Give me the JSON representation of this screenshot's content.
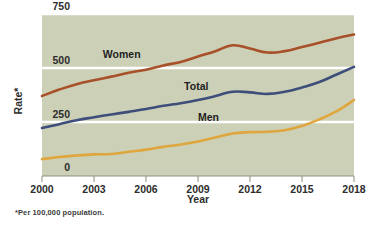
{
  "chart_data": {
    "type": "line",
    "title": "",
    "xlabel": "Year",
    "ylabel": "Rate*",
    "footnote": "*Per 100,000 population.",
    "x": [
      2000,
      2001,
      2002,
      2003,
      2004,
      2005,
      2006,
      2007,
      2008,
      2009,
      2010,
      2011,
      2012,
      2013,
      2014,
      2015,
      2016,
      2017,
      2018
    ],
    "xlim": [
      2000,
      2018
    ],
    "ylim": [
      0,
      750
    ],
    "yticks": [
      0,
      250,
      500,
      750
    ],
    "ytick_labels": [
      "0",
      "250",
      "500",
      "750"
    ],
    "xticks": [
      2000,
      2003,
      2006,
      2009,
      2012,
      2015,
      2018
    ],
    "xtick_labels": [
      "2000",
      "2003",
      "2006",
      "2009",
      "2012",
      "2015",
      "2018"
    ],
    "grid": true,
    "grid_color": "#ffffff",
    "plot_background": "#ccd0b6",
    "legend_position": "inline-labels",
    "series": [
      {
        "name": "Women",
        "color": "#a8502a",
        "label_x": 2004.6,
        "label_y": 545,
        "values": [
          370,
          400,
          425,
          443,
          460,
          478,
          492,
          512,
          528,
          553,
          578,
          605,
          590,
          572,
          578,
          597,
          617,
          638,
          655
        ]
      },
      {
        "name": "Total",
        "color": "#3d4e7a",
        "label_x": 2008.9,
        "label_y": 400,
        "values": [
          222,
          240,
          258,
          272,
          285,
          297,
          310,
          325,
          337,
          352,
          370,
          390,
          387,
          380,
          390,
          410,
          435,
          470,
          505
        ]
      },
      {
        "name": "Men",
        "color": "#e0a63e",
        "label_x": 2009.6,
        "label_y": 255,
        "values": [
          78,
          88,
          95,
          100,
          102,
          112,
          122,
          135,
          146,
          160,
          178,
          197,
          203,
          205,
          212,
          232,
          262,
          300,
          352
        ]
      }
    ]
  }
}
